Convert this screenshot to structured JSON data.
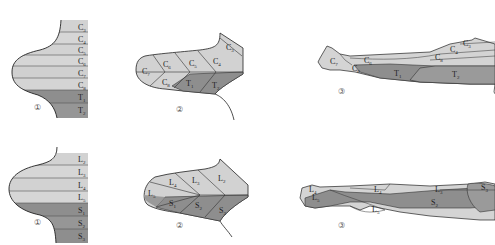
{
  "colors": {
    "light": "#d6d6d6",
    "light2": "#cfcfcf",
    "mid": "#c2c2c2",
    "dark": "#8e8e8e",
    "dark2": "#9a9a9a",
    "outline": "#333333"
  },
  "upper_row": {
    "title": "Upper limb dermatomes",
    "panel1": {
      "number": "①",
      "bands": [
        {
          "root": "C",
          "sub": "3"
        },
        {
          "root": "C",
          "sub": "4"
        },
        {
          "root": "C",
          "sub": "5"
        },
        {
          "root": "C",
          "sub": "6"
        },
        {
          "root": "C",
          "sub": "7"
        },
        {
          "root": "C",
          "sub": "8"
        },
        {
          "root": "T",
          "sub": "1"
        },
        {
          "root": "T",
          "sub": "2"
        }
      ]
    },
    "panel2": {
      "number": "②",
      "labels": [
        {
          "root": "C",
          "sub": "7"
        },
        {
          "root": "C",
          "sub": "6"
        },
        {
          "root": "C",
          "sub": "5"
        },
        {
          "root": "C",
          "sub": "4"
        },
        {
          "root": "C",
          "sub": "3"
        },
        {
          "root": "C",
          "sub": "8"
        },
        {
          "root": "T",
          "sub": "1"
        },
        {
          "root": "T",
          "sub": "2"
        }
      ]
    },
    "panel3": {
      "number": "③",
      "labels": [
        {
          "root": "C",
          "sub": "7"
        },
        {
          "root": "C",
          "sub": "6"
        },
        {
          "root": "C",
          "sub": "8"
        },
        {
          "root": "C",
          "sub": "4"
        },
        {
          "root": "C",
          "sub": "3"
        },
        {
          "root": "C",
          "sub": "8"
        },
        {
          "root": "T",
          "sub": "1"
        },
        {
          "root": "T",
          "sub": "2"
        }
      ]
    }
  },
  "lower_row": {
    "title": "Lower limb dermatomes",
    "panel1": {
      "number": "①",
      "bands": [
        {
          "root": "L",
          "sub": "2"
        },
        {
          "root": "L",
          "sub": "3"
        },
        {
          "root": "L",
          "sub": "4"
        },
        {
          "root": "L",
          "sub": "5"
        },
        {
          "root": "S",
          "sub": "1"
        },
        {
          "root": "S",
          "sub": "2"
        },
        {
          "root": "S",
          "sub": "3"
        }
      ]
    },
    "panel2": {
      "number": "②",
      "labels": [
        {
          "root": "L",
          "sub": "5"
        },
        {
          "root": "L",
          "sub": "4"
        },
        {
          "root": "L",
          "sub": "3"
        },
        {
          "root": "L",
          "sub": "2"
        },
        {
          "root": "S",
          "sub": "1"
        },
        {
          "root": "S",
          "sub": "2"
        },
        {
          "root": "S",
          "sub": "3"
        }
      ]
    },
    "panel3": {
      "number": "③",
      "labels": [
        {
          "root": "L",
          "sub": "4"
        },
        {
          "root": "L",
          "sub": "5"
        },
        {
          "root": "L",
          "sub": "4"
        },
        {
          "root": "L",
          "sub": "3"
        },
        {
          "root": "L",
          "sub": "5"
        },
        {
          "root": "S",
          "sub": "2"
        },
        {
          "root": "S",
          "sub": "3"
        }
      ]
    }
  }
}
